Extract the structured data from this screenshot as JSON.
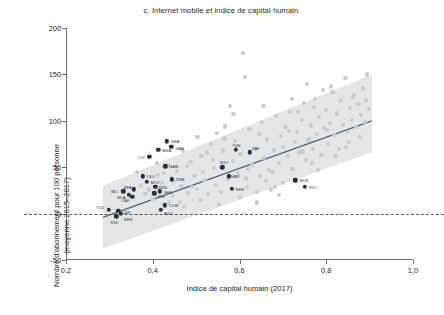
{
  "chart_data": {
    "type": "scatter",
    "title": "c. Internet mobile et indice de capital humain",
    "xlabel": "Indice de capital humain (2017)",
    "ylabel_line1": "Nombre d'abonnement pour 100 personne",
    "ylabel_line2": "(moyenne 2015–2017)",
    "xlim": [
      0.2,
      1.0
    ],
    "ylim": [
      -50,
      200
    ],
    "xticks": [
      0.2,
      0.4,
      0.6,
      0.8,
      1.0
    ],
    "xtick_labels": [
      "0,2",
      "0,4",
      "0,6",
      "0,8",
      "1,0"
    ],
    "yticks": [
      -50,
      0,
      50,
      100,
      150,
      200
    ],
    "ytick_labels": [
      "-50",
      "0",
      "50",
      "100",
      "150",
      "200"
    ],
    "grid": false,
    "legend_position": "none",
    "zero_reference_line": 0,
    "colors": {
      "africa_marker": "#2b2f3a",
      "other_marker": "#c9cbcd",
      "band_fill": "#e4e5e6",
      "fit_line": "#5a6170",
      "axis": "#6d6e71",
      "text": "#231f20"
    },
    "fit_line": {
      "x_start": 0.285,
      "y_start": -4,
      "x_end": 0.905,
      "y_end": 100,
      "note": "tendance lineaire"
    },
    "confidence_band": {
      "x_start": 0.285,
      "x_end": 0.905,
      "lower_start": -38,
      "upper_start": 30,
      "lower_end": 66,
      "upper_end": 150
    },
    "series": [
      {
        "name": "Afrique (pays etiquetes)",
        "marker_color": "#2b2f3a",
        "points": [
          {
            "label": "TCD",
            "x": 0.299,
            "y": 4,
            "label_dx": -13,
            "label_dy": -3
          },
          {
            "label": "SSD",
            "x": 0.316,
            "y": -3,
            "label_dx": -6,
            "label_dy": 6
          },
          {
            "label": "LBR",
            "x": 0.321,
            "y": 3,
            "label_dx": 4,
            "label_dy": 1
          },
          {
            "label": "NER",
            "x": 0.327,
            "y": 0,
            "label_dx": 3,
            "label_dy": 5
          },
          {
            "label": "MLI",
            "x": 0.332,
            "y": 24,
            "label_dx": -12,
            "label_dy": 0
          },
          {
            "label": "NGA",
            "x": 0.345,
            "y": 20,
            "label_dx": -12,
            "label_dy": 2
          },
          {
            "label": "CAF",
            "x": 0.353,
            "y": 18,
            "label_dx": -11,
            "label_dy": 3
          },
          {
            "label": "BFA",
            "x": 0.357,
            "y": 26,
            "label_dx": -10,
            "label_dy": -2
          },
          {
            "label": "LSO",
            "x": 0.377,
            "y": 40,
            "label_dx": 4,
            "label_dy": 0
          },
          {
            "label": "MOZ",
            "x": 0.386,
            "y": 34,
            "label_dx": 4,
            "label_dy": 0
          },
          {
            "label": "CIV",
            "x": 0.392,
            "y": 61,
            "label_dx": -11,
            "label_dy": 0
          },
          {
            "label": "BWA",
            "x": 0.413,
            "y": 69,
            "label_dx": 4,
            "label_dy": 0
          },
          {
            "label": "GHA",
            "x": 0.432,
            "y": 78,
            "label_dx": 4,
            "label_dy": 0
          },
          {
            "label": "GAB",
            "x": 0.443,
            "y": 72,
            "label_dx": 4,
            "label_dy": 1
          },
          {
            "label": "NAM",
            "x": 0.429,
            "y": 51,
            "label_dx": 4,
            "label_dy": 0
          },
          {
            "label": "ZWE",
            "x": 0.444,
            "y": 37,
            "label_dx": 4,
            "label_dy": 0
          },
          {
            "label": "ZMB",
            "x": 0.406,
            "y": 29,
            "label_dx": 3,
            "label_dy": 0
          },
          {
            "label": "SEN",
            "x": 0.416,
            "y": 24,
            "label_dx": 4,
            "label_dy": 1
          },
          {
            "label": "GIN",
            "x": 0.404,
            "y": 22,
            "label_dx": 3,
            "label_dy": 3
          },
          {
            "label": "COG",
            "x": 0.428,
            "y": 9,
            "label_dx": 4,
            "label_dy": 0
          },
          {
            "label": "AGO",
            "x": 0.419,
            "y": 4,
            "label_dx": 3,
            "label_dy": 3
          },
          {
            "label": "TUN",
            "x": 0.592,
            "y": 69,
            "label_dx": -4,
            "label_dy": -5
          },
          {
            "label": "ZAF",
            "x": 0.624,
            "y": 66,
            "label_dx": 2,
            "label_dy": -4
          },
          {
            "label": "EGY",
            "x": 0.56,
            "y": 50,
            "label_dx": -2,
            "label_dy": -5
          },
          {
            "label": "MAR",
            "x": 0.575,
            "y": 40,
            "label_dx": 2,
            "label_dy": 0
          },
          {
            "label": "KEN",
            "x": 0.582,
            "y": 27,
            "label_dx": 4,
            "label_dy": 0
          },
          {
            "label": "MUS",
            "x": 0.729,
            "y": 36,
            "label_dx": 4,
            "label_dy": 0
          },
          {
            "label": "SYC",
            "x": 0.751,
            "y": 29,
            "label_dx": 4,
            "label_dy": 0
          }
        ]
      },
      {
        "name": "Autres pays",
        "marker_color": "#c9cbcd",
        "points": [
          {
            "x": 0.364,
            "y": 45
          },
          {
            "x": 0.372,
            "y": 30
          },
          {
            "x": 0.392,
            "y": 26
          },
          {
            "x": 0.399,
            "y": 16
          },
          {
            "x": 0.411,
            "y": 42
          },
          {
            "x": 0.421,
            "y": 33
          },
          {
            "x": 0.437,
            "y": 12
          },
          {
            "x": 0.447,
            "y": 19
          },
          {
            "x": 0.456,
            "y": 46
          },
          {
            "x": 0.466,
            "y": 30
          },
          {
            "x": 0.472,
            "y": 7
          },
          {
            "x": 0.481,
            "y": 22
          },
          {
            "x": 0.487,
            "y": 56
          },
          {
            "x": 0.496,
            "y": 41
          },
          {
            "x": 0.503,
            "y": 83
          },
          {
            "x": 0.512,
            "y": 62
          },
          {
            "x": 0.519,
            "y": 36
          },
          {
            "x": 0.527,
            "y": 21
          },
          {
            "x": 0.534,
            "y": 75
          },
          {
            "x": 0.541,
            "y": 49
          },
          {
            "x": 0.548,
            "y": 87
          },
          {
            "x": 0.553,
            "y": 10
          },
          {
            "x": 0.561,
            "y": 68
          },
          {
            "x": 0.567,
            "y": 94
          },
          {
            "x": 0.573,
            "y": 37
          },
          {
            "x": 0.578,
            "y": 116
          },
          {
            "x": 0.584,
            "y": 57
          },
          {
            "x": 0.589,
            "y": 78
          },
          {
            "x": 0.596,
            "y": 44
          },
          {
            "x": 0.602,
            "y": 64
          },
          {
            "x": 0.608,
            "y": 173
          },
          {
            "x": 0.612,
            "y": 147
          },
          {
            "x": 0.617,
            "y": 29
          },
          {
            "x": 0.623,
            "y": 91
          },
          {
            "x": 0.629,
            "y": 53
          },
          {
            "x": 0.635,
            "y": 70
          },
          {
            "x": 0.641,
            "y": 23
          },
          {
            "x": 0.647,
            "y": 41
          },
          {
            "x": 0.652,
            "y": 99
          },
          {
            "x": 0.657,
            "y": 60
          },
          {
            "x": 0.663,
            "y": 80
          },
          {
            "x": 0.668,
            "y": 47
          },
          {
            "x": 0.673,
            "y": 26
          },
          {
            "x": 0.679,
            "y": 68
          },
          {
            "x": 0.684,
            "y": 105
          },
          {
            "x": 0.69,
            "y": 55
          },
          {
            "x": 0.695,
            "y": 84
          },
          {
            "x": 0.701,
            "y": 72
          },
          {
            "x": 0.706,
            "y": 93
          },
          {
            "x": 0.711,
            "y": 62
          },
          {
            "x": 0.716,
            "y": 110
          },
          {
            "x": 0.722,
            "y": 48
          },
          {
            "x": 0.727,
            "y": 77
          },
          {
            "x": 0.733,
            "y": 88
          },
          {
            "x": 0.738,
            "y": 66
          },
          {
            "x": 0.743,
            "y": 101
          },
          {
            "x": 0.748,
            "y": 119
          },
          {
            "x": 0.754,
            "y": 58
          },
          {
            "x": 0.759,
            "y": 80
          },
          {
            "x": 0.764,
            "y": 95
          },
          {
            "x": 0.769,
            "y": 70
          },
          {
            "x": 0.774,
            "y": 124
          },
          {
            "x": 0.779,
            "y": 86
          },
          {
            "x": 0.784,
            "y": 104
          },
          {
            "x": 0.789,
            "y": 63
          },
          {
            "x": 0.794,
            "y": 92
          },
          {
            "x": 0.799,
            "y": 112
          },
          {
            "x": 0.804,
            "y": 75
          },
          {
            "x": 0.809,
            "y": 98
          },
          {
            "x": 0.814,
            "y": 131
          },
          {
            "x": 0.819,
            "y": 85
          },
          {
            "x": 0.824,
            "y": 108
          },
          {
            "x": 0.829,
            "y": 70
          },
          {
            "x": 0.834,
            "y": 122
          },
          {
            "x": 0.839,
            "y": 96
          },
          {
            "x": 0.844,
            "y": 146
          },
          {
            "x": 0.849,
            "y": 88
          },
          {
            "x": 0.854,
            "y": 114
          },
          {
            "x": 0.859,
            "y": 101
          },
          {
            "x": 0.864,
            "y": 128
          },
          {
            "x": 0.869,
            "y": 93
          },
          {
            "x": 0.874,
            "y": 118
          },
          {
            "x": 0.879,
            "y": 106
          },
          {
            "x": 0.884,
            "y": 135
          },
          {
            "x": 0.889,
            "y": 99
          },
          {
            "x": 0.894,
            "y": 150
          },
          {
            "x": 0.899,
            "y": 113
          },
          {
            "x": 0.47,
            "y": 68
          },
          {
            "x": 0.51,
            "y": 15
          },
          {
            "x": 0.545,
            "y": 31
          },
          {
            "x": 0.6,
            "y": 18
          },
          {
            "x": 0.64,
            "y": 12
          },
          {
            "x": 0.66,
            "y": 35
          },
          {
            "x": 0.69,
            "y": 20
          },
          {
            "x": 0.72,
            "y": 124
          },
          {
            "x": 0.755,
            "y": 140
          },
          {
            "x": 0.78,
            "y": 47
          },
          {
            "x": 0.81,
            "y": 137
          },
          {
            "x": 0.845,
            "y": 72
          },
          {
            "x": 0.862,
            "y": 126
          },
          {
            "x": 0.877,
            "y": 83
          },
          {
            "x": 0.892,
            "y": 122
          },
          {
            "x": 0.435,
            "y": 52
          },
          {
            "x": 0.455,
            "y": 9
          },
          {
            "x": 0.49,
            "y": 29
          },
          {
            "x": 0.525,
            "y": 66
          },
          {
            "x": 0.557,
            "y": 23
          },
          {
            "x": 0.586,
            "y": 107
          },
          {
            "x": 0.614,
            "y": 38
          },
          {
            "x": 0.646,
            "y": 86
          },
          {
            "x": 0.676,
            "y": 45
          },
          {
            "x": 0.7,
            "y": 33
          },
          {
            "x": 0.735,
            "y": 110
          },
          {
            "x": 0.766,
            "y": 55
          },
          {
            "x": 0.792,
            "y": 133
          },
          {
            "x": 0.821,
            "y": 62
          },
          {
            "x": 0.853,
            "y": 77
          },
          {
            "x": 0.383,
            "y": 21
          },
          {
            "x": 0.409,
            "y": 55
          },
          {
            "x": 0.426,
            "y": 44
          },
          {
            "x": 0.449,
            "y": 35
          },
          {
            "x": 0.462,
            "y": 13
          },
          {
            "x": 0.478,
            "y": 51
          },
          {
            "x": 0.501,
            "y": 27
          },
          {
            "x": 0.516,
            "y": 45
          },
          {
            "x": 0.538,
            "y": 58
          },
          {
            "x": 0.565,
            "y": 81
          },
          {
            "x": 0.594,
            "y": 72
          },
          {
            "x": 0.62,
            "y": 48
          },
          {
            "x": 0.655,
            "y": 116
          },
          {
            "x": 0.682,
            "y": 29
          },
          {
            "x": 0.713,
            "y": 89
          },
          {
            "x": 0.745,
            "y": 67
          },
          {
            "x": 0.772,
            "y": 115
          },
          {
            "x": 0.801,
            "y": 90
          }
        ]
      }
    ]
  }
}
